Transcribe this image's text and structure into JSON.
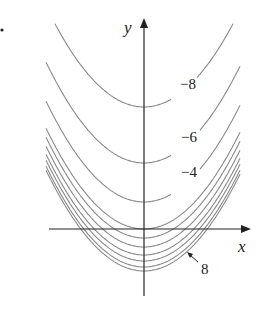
{
  "chart_data": {
    "type": "line",
    "title": "",
    "xlabel": "x",
    "ylabel": "y",
    "grid": false,
    "legend": null,
    "curve_labels": [
      {
        "text": "−8",
        "level": -8
      },
      {
        "text": "−6",
        "level": -6
      },
      {
        "text": "−4",
        "level": -4
      },
      {
        "text": "8",
        "level": 8,
        "annotation": "arrow pointing to lowest curve"
      }
    ],
    "series": [
      {
        "name": "level -8",
        "level": -8,
        "vertex_px": 107
      },
      {
        "name": "level -6",
        "level": -6,
        "vertex_px": 163
      },
      {
        "name": "level -4",
        "level": -4,
        "vertex_px": 202
      },
      {
        "name": "level -2",
        "level": -2,
        "vertex_px": 229
      },
      {
        "name": "level 0",
        "level": 0,
        "vertex_px": 238
      },
      {
        "name": "level 2",
        "level": 2,
        "vertex_px": 247
      },
      {
        "name": "level 4",
        "level": 4,
        "vertex_px": 255
      },
      {
        "name": "level 6",
        "level": 6,
        "vertex_px": 261
      },
      {
        "name": "level 7",
        "level": 7,
        "vertex_px": 267
      },
      {
        "name": "level 8",
        "level": 8,
        "vertex_px": 271
      }
    ]
  },
  "labels": {
    "x_axis": "x",
    "y_axis": "y",
    "l_m8": "−8",
    "l_m6": "−6",
    "l_m4": "−4",
    "l_8": "8"
  }
}
